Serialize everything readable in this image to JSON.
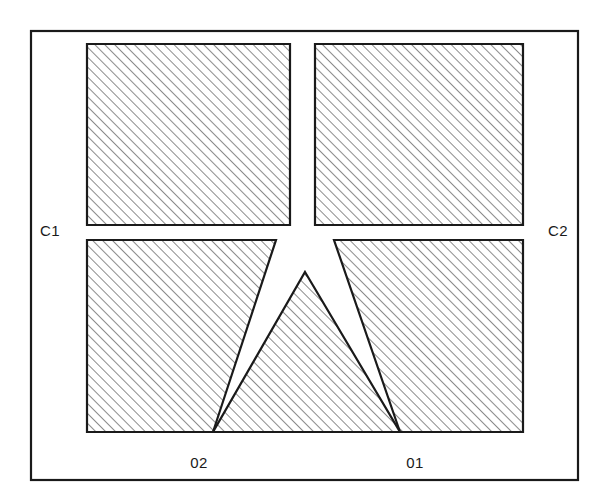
{
  "diagram": {
    "background_color": "#ffffff",
    "line_color": "#1a1a1a",
    "hatch_color": "#2b2b2b",
    "frame": {
      "name": "outer-frame",
      "x": 31,
      "y": 31,
      "width": 547,
      "height": 449,
      "stroke_width": 2.2
    },
    "hatch": {
      "angle_degrees": 45,
      "spacing_px": 7,
      "stroke_width": 1.1
    },
    "regions": [
      {
        "id": "top-left-region",
        "shape": "rectangle",
        "points": "87,44 290,44 290,225 87,225"
      },
      {
        "id": "top-right-region",
        "shape": "rectangle",
        "points": "315,44 523,44 523,225 315,225"
      },
      {
        "id": "bottom-left-region",
        "shape": "quadrilateral",
        "points": "87,240 276,240 213,432 87,432"
      },
      {
        "id": "bottom-right-region",
        "shape": "quadrilateral",
        "points": "334,240 523,240 523,432 400,432"
      },
      {
        "id": "center-triangle-region",
        "shape": "triangle",
        "points": "305,272 400,432 213,432"
      }
    ],
    "labels": [
      {
        "id": "label-c1",
        "text": "C1",
        "x": 40,
        "y": 236,
        "anchor": "start"
      },
      {
        "id": "label-c2",
        "text": "C2",
        "x": 548,
        "y": 236,
        "anchor": "start"
      },
      {
        "id": "label-02",
        "text": "02",
        "x": 199,
        "y": 468,
        "anchor": "middle"
      },
      {
        "id": "label-01",
        "text": "01",
        "x": 415,
        "y": 468,
        "anchor": "middle"
      }
    ]
  }
}
